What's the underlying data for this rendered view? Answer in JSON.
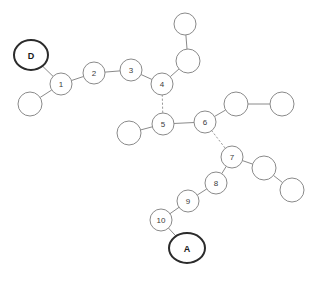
{
  "diagram": {
    "background_color": "#ffffff",
    "stroke_color": "#8a8a8a",
    "terminal_stroke_color": "#2b2b2b",
    "label_color": "#3c3c3c",
    "width": 317,
    "height": 281
  },
  "nodes": [
    {
      "id": "D",
      "label": "D",
      "x": 31,
      "y": 55,
      "rx": 17,
      "ry": 15,
      "kind": "terminal"
    },
    {
      "id": "n1",
      "label": "1",
      "x": 61,
      "y": 84,
      "rx": 11,
      "ry": 11,
      "kind": "numbered"
    },
    {
      "id": "u1",
      "label": "",
      "x": 30,
      "y": 104,
      "rx": 12,
      "ry": 12,
      "kind": "plain"
    },
    {
      "id": "n2",
      "label": "2",
      "x": 94,
      "y": 73,
      "rx": 11,
      "ry": 11,
      "kind": "numbered"
    },
    {
      "id": "n3",
      "label": "3",
      "x": 131,
      "y": 70,
      "rx": 11,
      "ry": 11,
      "kind": "numbered"
    },
    {
      "id": "n4",
      "label": "4",
      "x": 162,
      "y": 84,
      "rx": 11,
      "ry": 11,
      "kind": "numbered"
    },
    {
      "id": "u2",
      "label": "",
      "x": 188,
      "y": 61,
      "rx": 12,
      "ry": 12,
      "kind": "plain"
    },
    {
      "id": "u3",
      "label": "",
      "x": 185,
      "y": 24,
      "rx": 11,
      "ry": 11,
      "kind": "plain"
    },
    {
      "id": "n5",
      "label": "5",
      "x": 163,
      "y": 124,
      "rx": 11,
      "ry": 11,
      "kind": "numbered"
    },
    {
      "id": "u4",
      "label": "",
      "x": 129,
      "y": 133,
      "rx": 12,
      "ry": 12,
      "kind": "plain"
    },
    {
      "id": "n6",
      "label": "6",
      "x": 205,
      "y": 122,
      "rx": 11,
      "ry": 11,
      "kind": "numbered"
    },
    {
      "id": "u5",
      "label": "",
      "x": 236,
      "y": 104,
      "rx": 12,
      "ry": 12,
      "kind": "plain"
    },
    {
      "id": "u6",
      "label": "",
      "x": 282,
      "y": 104,
      "rx": 12,
      "ry": 12,
      "kind": "plain"
    },
    {
      "id": "n7",
      "label": "7",
      "x": 232,
      "y": 157,
      "rx": 11,
      "ry": 11,
      "kind": "numbered"
    },
    {
      "id": "u7",
      "label": "",
      "x": 264,
      "y": 168,
      "rx": 12,
      "ry": 12,
      "kind": "plain"
    },
    {
      "id": "u8",
      "label": "",
      "x": 292,
      "y": 190,
      "rx": 12,
      "ry": 12,
      "kind": "plain"
    },
    {
      "id": "n8",
      "label": "8",
      "x": 216,
      "y": 183,
      "rx": 11,
      "ry": 11,
      "kind": "numbered"
    },
    {
      "id": "n9",
      "label": "9",
      "x": 188,
      "y": 201,
      "rx": 11,
      "ry": 11,
      "kind": "numbered"
    },
    {
      "id": "n10",
      "label": "10",
      "x": 161,
      "y": 220,
      "rx": 11,
      "ry": 11,
      "kind": "numbered"
    },
    {
      "id": "A",
      "label": "A",
      "x": 187,
      "y": 248,
      "rx": 18,
      "ry": 15,
      "kind": "terminal"
    }
  ],
  "edges": [
    {
      "from": "D",
      "to": "n1",
      "style": "solid"
    },
    {
      "from": "u1",
      "to": "n1",
      "style": "solid"
    },
    {
      "from": "n1",
      "to": "n2",
      "style": "solid"
    },
    {
      "from": "n2",
      "to": "n3",
      "style": "solid"
    },
    {
      "from": "n3",
      "to": "n4",
      "style": "solid"
    },
    {
      "from": "n4",
      "to": "u2",
      "style": "solid"
    },
    {
      "from": "u2",
      "to": "u3",
      "style": "solid"
    },
    {
      "from": "n4",
      "to": "n5",
      "style": "dotted"
    },
    {
      "from": "u4",
      "to": "n5",
      "style": "solid"
    },
    {
      "from": "n5",
      "to": "n6",
      "style": "solid"
    },
    {
      "from": "n6",
      "to": "u5",
      "style": "solid"
    },
    {
      "from": "u5",
      "to": "u6",
      "style": "solid"
    },
    {
      "from": "n6",
      "to": "n7",
      "style": "dotted"
    },
    {
      "from": "n7",
      "to": "u7",
      "style": "solid"
    },
    {
      "from": "u7",
      "to": "u8",
      "style": "solid"
    },
    {
      "from": "n7",
      "to": "n8",
      "style": "solid"
    },
    {
      "from": "n8",
      "to": "n9",
      "style": "solid"
    },
    {
      "from": "n9",
      "to": "n10",
      "style": "solid"
    },
    {
      "from": "n10",
      "to": "A",
      "style": "solid"
    }
  ]
}
